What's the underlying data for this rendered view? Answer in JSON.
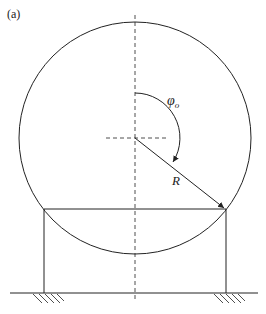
{
  "figure": {
    "panel_label": "(a)",
    "angle_label": "φ",
    "angle_subscript": "o",
    "radius_label": "R"
  },
  "colors": {
    "stroke": "#222222",
    "background": "#ffffff"
  }
}
